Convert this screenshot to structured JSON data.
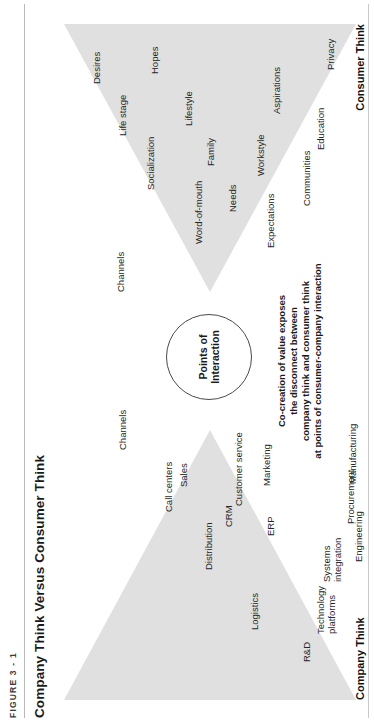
{
  "figure": {
    "number": "FIGURE 3 - 1",
    "title": "Company Think Versus Consumer Think"
  },
  "center": {
    "circle_line1": "Points of",
    "circle_line2": "Interaction",
    "caption": "Co-creation of value exposes\nthe disconnect between\ncompany think and consumer think\nat points of consumer-company interaction"
  },
  "company_think": {
    "axis_label": "Company Think",
    "nodes": [
      {
        "label": "R&D",
        "x": 60,
        "y": 248
      },
      {
        "label": "Logistics",
        "x": 92,
        "y": 196
      },
      {
        "label": "Technology\nplatforms",
        "x": 88,
        "y": 262
      },
      {
        "label": "Distribution",
        "x": 152,
        "y": 150
      },
      {
        "label": "Systems\nintegration",
        "x": 140,
        "y": 268
      },
      {
        "label": "ERP",
        "x": 186,
        "y": 212
      },
      {
        "label": "CRM",
        "x": 195,
        "y": 170
      },
      {
        "label": "Call centers",
        "x": 210,
        "y": 110
      },
      {
        "label": "Sales",
        "x": 235,
        "y": 125
      },
      {
        "label": "Customer service",
        "x": 216,
        "y": 180
      },
      {
        "label": "Engineering",
        "x": 160,
        "y": 300
      },
      {
        "label": "Procurement",
        "x": 198,
        "y": 292
      },
      {
        "label": "Marketing",
        "x": 236,
        "y": 208
      },
      {
        "label": "Manufacturing",
        "x": 238,
        "y": 294
      },
      {
        "label": "Channels",
        "x": 272,
        "y": 64
      }
    ]
  },
  "consumer_think": {
    "axis_label": "Consumer Think",
    "nodes": [
      {
        "label": "Channels",
        "x": 430,
        "y": 62
      },
      {
        "label": "Expectations",
        "x": 474,
        "y": 212
      },
      {
        "label": "Word-of-mouth",
        "x": 478,
        "y": 140
      },
      {
        "label": "Needs",
        "x": 510,
        "y": 174
      },
      {
        "label": "Communities",
        "x": 516,
        "y": 248
      },
      {
        "label": "Socialization",
        "x": 532,
        "y": 92
      },
      {
        "label": "Workstyle",
        "x": 546,
        "y": 202
      },
      {
        "label": "Family",
        "x": 556,
        "y": 152
      },
      {
        "label": "Education",
        "x": 572,
        "y": 262
      },
      {
        "label": "Life stage",
        "x": 586,
        "y": 64
      },
      {
        "label": "Lifestyle",
        "x": 596,
        "y": 130
      },
      {
        "label": "Aspirations",
        "x": 608,
        "y": 218
      },
      {
        "label": "Desires",
        "x": 638,
        "y": 38
      },
      {
        "label": "Hopes",
        "x": 648,
        "y": 96
      },
      {
        "label": "Privacy",
        "x": 652,
        "y": 272
      }
    ]
  },
  "colors": {
    "triangle_fill": "#e0e0e0",
    "text": "#1a1a1a",
    "rule": "#b9b9b9"
  }
}
